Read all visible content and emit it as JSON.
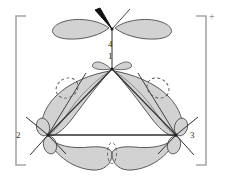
{
  "figure": {
    "kind": "molecular-orbital-diagram",
    "charge_label": "+",
    "background_color": "#ffffff",
    "lobe_fill_color": "#d2d2d2",
    "lobe_stroke_color": "#4a4a4a",
    "bond_color": "#3a3a3a",
    "node_stroke_color": "#555555",
    "bracket_color": "#9a9a9a",
    "wedge_color": "#111111"
  },
  "brackets": {
    "left": "[",
    "right": "]",
    "superscript": "+"
  },
  "atoms": [
    {
      "id": "atom-1",
      "label": "1",
      "role": "apex-center",
      "x": 112,
      "y": 69,
      "label_x": 108,
      "label_y": 55
    },
    {
      "id": "atom-2",
      "label": "2",
      "role": "bottom-left",
      "x": 48,
      "y": 135,
      "label_x": 17,
      "label_y": 135
    },
    {
      "id": "atom-3",
      "label": "3",
      "role": "bottom-right",
      "x": 176,
      "y": 135,
      "label_x": 188,
      "label_y": 135
    },
    {
      "id": "atom-4",
      "label": "4",
      "role": "top-exocyclic",
      "x": 112,
      "y": 28,
      "label_x": 108,
      "label_y": 40
    }
  ],
  "nodes": [
    {
      "id": "node-left",
      "label": "nodal-plane-left",
      "cx": 67,
      "cy": 88,
      "rx": 11,
      "ry": 9,
      "rotation": -30
    },
    {
      "id": "node-right",
      "label": "nodal-plane-right",
      "cx": 158,
      "cy": 88,
      "rx": 11,
      "ry": 9,
      "rotation": 30
    },
    {
      "id": "node-bottom",
      "label": "nodal-plane-bottom",
      "cx": 112,
      "cy": 152,
      "rx": 4,
      "ry": 10,
      "rotation": 0
    }
  ],
  "bonds": [
    {
      "id": "bond-1-2",
      "from": "1",
      "to": "2",
      "style": "line"
    },
    {
      "id": "bond-1-3",
      "from": "1",
      "to": "3",
      "style": "line"
    },
    {
      "id": "bond-2-3",
      "from": "2",
      "to": "3",
      "style": "line"
    },
    {
      "id": "bond-1-4",
      "from": "1",
      "to": "4",
      "style": "line"
    },
    {
      "id": "bond-4-substituent-bold",
      "from": "4",
      "to": "substituent",
      "style": "bold-wedge"
    },
    {
      "id": "bond-4-substituent-thin",
      "from": "4",
      "to": "substituent",
      "style": "line"
    }
  ]
}
